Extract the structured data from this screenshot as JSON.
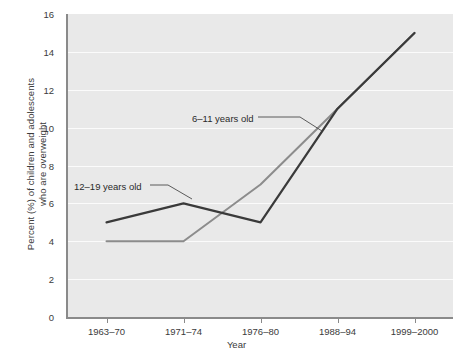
{
  "chart_data": {
    "type": "line",
    "title": "",
    "xlabel": "Year",
    "ylabel": "Percent (%) of children and adolescents who are overweight",
    "ylabel_line1": "Percent (%) of children and adolescents",
    "ylabel_line2": "who are overweight",
    "categories": [
      "1963–70",
      "1971–74",
      "1976–80",
      "1988–94",
      "1999–2000"
    ],
    "series": [
      {
        "name": "6–11 years old",
        "values": [
          4,
          4,
          7,
          11,
          15
        ],
        "color": "#8c8c8c"
      },
      {
        "name": "12–19 years old",
        "values": [
          5,
          6,
          5,
          11,
          15
        ],
        "color": "#3a3a3a"
      }
    ],
    "ylim": [
      0,
      16
    ],
    "ytick_values": [
      0,
      2,
      4,
      6,
      8,
      10,
      12,
      14,
      16
    ],
    "ytick_labels": [
      "0",
      "2",
      "4",
      "6",
      "8",
      "10",
      "12",
      "14",
      "16"
    ],
    "grid": true,
    "grid_color": "#fbfbfb",
    "plot_background": "#e9e9e9",
    "legend": "inline-annotations",
    "annotations": [
      {
        "text": "6–11 years old",
        "series": "6–11 years old"
      },
      {
        "text": "12–19 years old",
        "series": "12–19 years old"
      }
    ]
  }
}
